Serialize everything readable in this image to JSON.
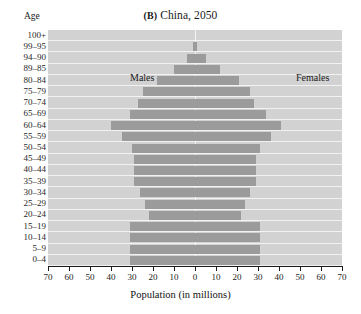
{
  "chart_data": {
    "type": "bar",
    "subtype": "population-pyramid",
    "title": "(B) China, 2050",
    "panel_letter": "(B)",
    "title_text": "China, 2050",
    "xlabel": "Population (in millions)",
    "ylabel": "Age",
    "xlim": [
      -70,
      70
    ],
    "xticks": [
      70,
      60,
      50,
      40,
      30,
      20,
      10,
      0,
      10,
      20,
      30,
      40,
      50,
      60,
      70
    ],
    "xtick_step": 10,
    "grid": true,
    "legend_position": "in-plot",
    "series_labels": [
      "Males",
      "Females"
    ],
    "categories": [
      "100+",
      "99–95",
      "94–90",
      "89–85",
      "80–84",
      "75–79",
      "70–74",
      "65–69",
      "60–64",
      "55–59",
      "50–54",
      "45–49",
      "40–44",
      "35–39",
      "30–34",
      "25–29",
      "20–24",
      "15–19",
      "10–14",
      "5–9",
      "0–4"
    ],
    "series": [
      {
        "name": "Males",
        "values": [
          0,
          1,
          4,
          10,
          18,
          25,
          27,
          31,
          40,
          35,
          30,
          29,
          29,
          29,
          26,
          24,
          22,
          31,
          31,
          31,
          31
        ]
      },
      {
        "name": "Females",
        "values": [
          0,
          1,
          5,
          12,
          21,
          26,
          28,
          34,
          41,
          36,
          31,
          29,
          29,
          29,
          26,
          24,
          22,
          31,
          31,
          31,
          31
        ]
      }
    ],
    "colors": {
      "bar": "#9b9b9b",
      "plot_background": "#d2d2d2",
      "gridline": "#f2f2f2",
      "axis": "#1a1a1a",
      "text": "#1a1a1a"
    }
  }
}
